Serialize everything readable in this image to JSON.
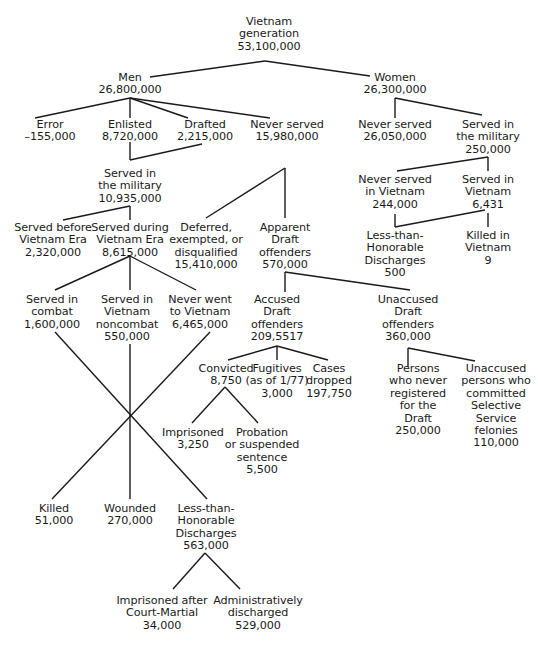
{
  "diagram": {
    "type": "tree",
    "title": "Vietnam generation",
    "nodes": {
      "root": {
        "lines": [
          "Vietnam",
          "generation",
          "53,100,000"
        ]
      },
      "men": {
        "lines": [
          "Men",
          "26,800,000"
        ]
      },
      "women": {
        "lines": [
          "Women",
          "26,300,000"
        ]
      },
      "error": {
        "lines": [
          "Error",
          "–155,000"
        ]
      },
      "enlisted": {
        "lines": [
          "Enlisted",
          "8,720,000"
        ]
      },
      "drafted": {
        "lines": [
          "Drafted",
          "2,215,000"
        ]
      },
      "men_never_served": {
        "lines": [
          "Never served",
          "15,980,000"
        ]
      },
      "women_never_served": {
        "lines": [
          "Never served",
          "26,050,000"
        ]
      },
      "women_served": {
        "lines": [
          "Served in",
          "the military",
          "250,000"
        ]
      },
      "men_served": {
        "lines": [
          "Served in",
          "the military",
          "10,935,000"
        ]
      },
      "women_never_vietnam": {
        "lines": [
          "Never served",
          "in Vietnam",
          "244,000"
        ]
      },
      "women_served_vietnam": {
        "lines": [
          "Served in",
          "Vietnam",
          "6,431"
        ]
      },
      "served_before": {
        "lines": [
          "Served before",
          "Vietnam Era",
          "2,320,000"
        ]
      },
      "served_during": {
        "lines": [
          "Served during",
          "Vietnam Era",
          "8,615,000"
        ]
      },
      "deferred": {
        "lines": [
          "Deferred,",
          "exempted, or",
          "disqualified",
          "15,410,000"
        ]
      },
      "apparent": {
        "lines": [
          "Apparent",
          "Draft",
          "offenders",
          "570,000"
        ]
      },
      "women_lth": {
        "lines": [
          "Less-than-",
          "Honorable",
          "Discharges",
          "500"
        ]
      },
      "women_killed": {
        "lines": [
          "Killed in",
          "Vietnam",
          "9"
        ]
      },
      "combat": {
        "lines": [
          "Served in",
          "combat",
          "1,600,000"
        ]
      },
      "noncombat": {
        "lines": [
          "Served in",
          "Vietnam",
          "noncombat",
          "550,000"
        ]
      },
      "never_went": {
        "lines": [
          "Never went",
          "to Vietnam",
          "6,465,000"
        ]
      },
      "accused": {
        "lines": [
          "Accused",
          "Draft",
          "offenders",
          "209,5517"
        ]
      },
      "unaccused": {
        "lines": [
          "Unaccused",
          "Draft",
          "offenders",
          "360,000"
        ]
      },
      "convicted": {
        "lines": [
          "Convicted",
          "8,750"
        ]
      },
      "fugitives": {
        "lines": [
          "Fugitives",
          "(as of 1/77)",
          "3,000"
        ]
      },
      "dropped": {
        "lines": [
          "Cases",
          "dropped",
          "197,750"
        ]
      },
      "never_registered": {
        "lines": [
          "Persons",
          "who never",
          "registered",
          "for the",
          "Draft",
          "250,000"
        ]
      },
      "unaccused_felonies": {
        "lines": [
          "Unaccused",
          "persons who",
          "committed",
          "Selective",
          "Service",
          "felonies",
          "110,000"
        ]
      },
      "imprisoned": {
        "lines": [
          "Imprisoned",
          "3,250"
        ]
      },
      "probation": {
        "lines": [
          "Probation",
          "or suspended",
          "sentence",
          "5,500"
        ]
      },
      "killed": {
        "lines": [
          "Killed",
          "51,000"
        ]
      },
      "wounded": {
        "lines": [
          "Wounded",
          "270,000"
        ]
      },
      "men_lth": {
        "lines": [
          "Less-than-",
          "Honorable",
          "Discharges",
          "563,000"
        ]
      },
      "court_martial": {
        "lines": [
          "Imprisoned after",
          "Court-Martial",
          "34,000"
        ]
      },
      "admin": {
        "lines": [
          "Administratively",
          "discharged",
          "529,000"
        ]
      }
    },
    "line_color": "#1a1a1a",
    "text_color": "#1a1a1a",
    "background": "#ffffff"
  }
}
